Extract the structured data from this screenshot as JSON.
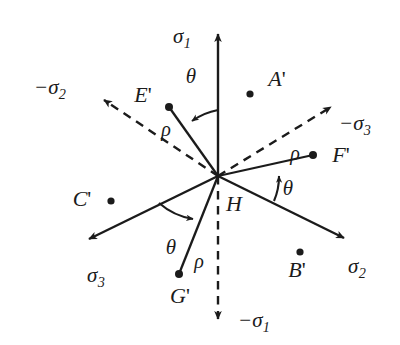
{
  "figure": {
    "type": "stress-space-axes-diagram",
    "background_color": "#ffffff",
    "ink_color": "#1b1b1b",
    "origin": {
      "x": 218,
      "y": 176
    }
  },
  "axes": [
    {
      "id": "sigma1",
      "label": "σ",
      "subscript": "1",
      "style": "solid",
      "label_x": 182,
      "label_y": 38,
      "tip_x": 218,
      "tip_y": 27
    },
    {
      "id": "sigma2",
      "label": "σ",
      "subscript": "2",
      "style": "solid",
      "label_x": 357,
      "label_y": 268,
      "tip_x": 351,
      "tip_y": 243
    },
    {
      "id": "sigma3",
      "label": "σ",
      "subscript": "3",
      "style": "solid",
      "label_x": 96,
      "label_y": 277,
      "tip_x": 82,
      "tip_y": 243
    },
    {
      "id": "neg-sigma1",
      "label": "−σ",
      "subscript": "1",
      "style": "dashed",
      "label_x": 254,
      "label_y": 322,
      "tip_x": 218,
      "tip_y": 327
    },
    {
      "id": "neg-sigma2",
      "label": "−σ",
      "subscript": "2",
      "style": "dashed",
      "label_x": 50,
      "label_y": 89,
      "tip_x": 97,
      "tip_y": 96
    },
    {
      "id": "neg-sigma3",
      "label": "−σ",
      "subscript": "3",
      "style": "dashed",
      "label_x": 355,
      "label_y": 125,
      "tip_x": 338,
      "tip_y": 101
    }
  ],
  "points": [
    {
      "id": "A",
      "label": "A",
      "prime": "'",
      "dot_x": 250,
      "dot_y": 94,
      "label_x": 277,
      "label_y": 79,
      "has_radius_line": false
    },
    {
      "id": "B",
      "label": "B",
      "prime": "'",
      "dot_x": 300,
      "dot_y": 252,
      "label_x": 297,
      "label_y": 270,
      "has_radius_line": false
    },
    {
      "id": "C",
      "label": "C",
      "prime": "'",
      "dot_x": 111,
      "dot_y": 201,
      "label_x": 82,
      "label_y": 199,
      "has_radius_line": false
    },
    {
      "id": "E",
      "label": "E",
      "prime": "'",
      "dot_x": 169,
      "dot_y": 107,
      "label_x": 143,
      "label_y": 95,
      "has_radius_line": true
    },
    {
      "id": "F",
      "label": "F",
      "prime": "'",
      "dot_x": 313,
      "dot_y": 155,
      "label_x": 341,
      "label_y": 155,
      "has_radius_line": true
    },
    {
      "id": "G",
      "label": "G",
      "prime": "'",
      "dot_x": 179,
      "dot_y": 274,
      "label_x": 180,
      "label_y": 296,
      "has_radius_line": true
    }
  ],
  "rho_labels": [
    {
      "id": "rho-E",
      "text": "ρ",
      "x": 166,
      "y": 129
    },
    {
      "id": "rho-F",
      "text": "ρ",
      "x": 295,
      "y": 153
    },
    {
      "id": "rho-G",
      "text": "ρ",
      "x": 199,
      "y": 261
    }
  ],
  "theta_labels": [
    {
      "id": "theta-top",
      "text": "θ",
      "x": 191,
      "y": 76
    },
    {
      "id": "theta-right",
      "text": "θ",
      "x": 288,
      "y": 188
    },
    {
      "id": "theta-bottom",
      "text": "θ",
      "x": 171,
      "y": 247
    }
  ],
  "center_label": {
    "id": "H",
    "text": "H",
    "x": 234,
    "y": 204
  }
}
